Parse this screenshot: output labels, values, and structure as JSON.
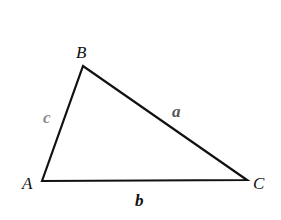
{
  "diagram": {
    "type": "triangle",
    "vertices": [
      {
        "name": "A",
        "x": 42,
        "y": 181,
        "label_x": 22,
        "label_y": 189
      },
      {
        "name": "B",
        "x": 83,
        "y": 66,
        "label_x": 76,
        "label_y": 58
      },
      {
        "name": "C",
        "x": 247,
        "y": 180,
        "label_x": 253,
        "label_y": 189
      }
    ],
    "sides": [
      {
        "name": "a",
        "between": "B-C",
        "label_x": 172,
        "label_y": 117,
        "color": "#555555"
      },
      {
        "name": "b",
        "between": "A-C",
        "label_x": 135,
        "label_y": 206,
        "color": "#111111"
      },
      {
        "name": "c",
        "between": "A-B",
        "label_x": 43,
        "label_y": 123,
        "color": "#8a8a8a"
      }
    ],
    "stroke_color": "#111111"
  }
}
